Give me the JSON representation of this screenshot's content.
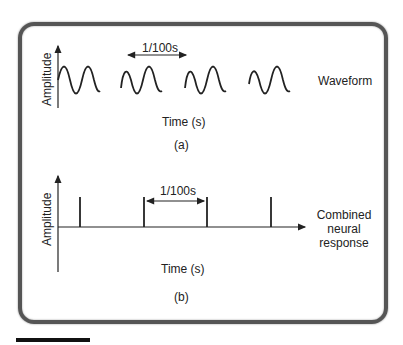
{
  "panel_a": {
    "y_axis_label": "Amplitude",
    "x_axis_label": "Time (s)",
    "series_label": "Waveform",
    "interval_label": "1/100s",
    "caption": "(a)"
  },
  "panel_b": {
    "y_axis_label": "Amplitude",
    "x_axis_label": "Time (s)",
    "series_label_line1": "Combined",
    "series_label_line2": "neural",
    "series_label_line3": "response",
    "interval_label": "1/100s",
    "caption": "(b)"
  },
  "colors": {
    "line": "#222222",
    "frame": "#555555"
  }
}
